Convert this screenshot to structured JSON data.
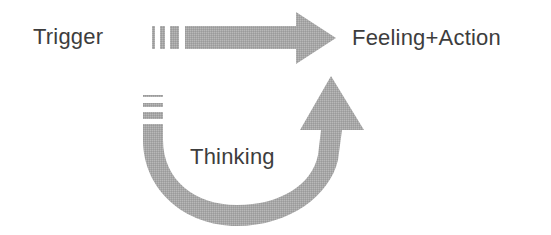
{
  "diagram": {
    "type": "flow-cycle",
    "nodes": [
      {
        "id": "trigger",
        "label": "Trigger"
      },
      {
        "id": "feeling_action",
        "label": "Feeling+Action"
      },
      {
        "id": "thinking",
        "label": "Thinking"
      }
    ],
    "edges": [
      {
        "from": "trigger",
        "to": "feeling_action",
        "style": "straight-arrow-dashed-tail"
      },
      {
        "from": "thinking",
        "to": "feeling_action",
        "style": "u-curve-arrow-dashed-tail"
      }
    ],
    "colors": {
      "arrow_fill": "#a7a7a7",
      "text": "#3d3d3d",
      "background": "#ffffff"
    }
  }
}
